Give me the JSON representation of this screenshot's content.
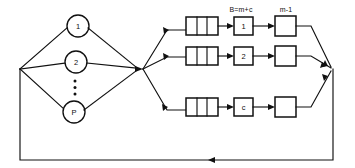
{
  "diagram": {
    "type": "closed-queueing-network",
    "column_labels": [
      {
        "id": "col-label-1",
        "text": "B=m+c",
        "x": 239,
        "y": 9
      },
      {
        "id": "col-label-2",
        "text": "m-1",
        "x": 285,
        "y": 9
      }
    ],
    "source_nodes": [
      {
        "id": "node-1",
        "label": "1",
        "cx": 78,
        "cy": 26,
        "r": 11
      },
      {
        "id": "node-2",
        "label": "2",
        "cx": 76,
        "cy": 62,
        "r": 11
      },
      {
        "id": "node-p",
        "label": "P",
        "cx": 74,
        "cy": 112,
        "r": 11
      }
    ],
    "ellipsis_dots": [
      {
        "cx": 75,
        "cy": 82
      },
      {
        "cx": 75,
        "cy": 88
      },
      {
        "cx": 75,
        "cy": 94
      }
    ],
    "queue_boxes": [
      {
        "id": "queue-row-1",
        "x": 186,
        "y": 17,
        "w": 32,
        "h": 18,
        "cells": 3
      },
      {
        "id": "queue-row-2",
        "x": 186,
        "y": 47,
        "w": 32,
        "h": 18,
        "cells": 3
      },
      {
        "id": "queue-row-3",
        "x": 186,
        "y": 98,
        "w": 32,
        "h": 18,
        "cells": 3
      }
    ],
    "service_boxes": [
      {
        "id": "service-box-1",
        "label": "1",
        "x": 234,
        "y": 17,
        "w": 19,
        "h": 18
      },
      {
        "id": "service-box-2",
        "label": "2",
        "x": 234,
        "y": 47,
        "w": 19,
        "h": 18
      },
      {
        "id": "service-box-c",
        "label": "c",
        "x": 234,
        "y": 98,
        "w": 19,
        "h": 18
      }
    ],
    "terminal_boxes": [
      {
        "id": "terminal-box-1",
        "label": "",
        "x": 275,
        "y": 16,
        "w": 21,
        "h": 20
      },
      {
        "id": "terminal-box-2",
        "label": "",
        "x": 275,
        "y": 46,
        "w": 21,
        "h": 20
      },
      {
        "id": "terminal-box-3",
        "label": "",
        "x": 275,
        "y": 97,
        "w": 21,
        "h": 20
      }
    ],
    "junctions": {
      "left_merge": {
        "x": 20,
        "y": 69
      },
      "center_split": {
        "x": 143,
        "y": 69
      },
      "right_merge": {
        "x": 333,
        "y": 69
      }
    },
    "outer_loop": {
      "left_x": 20,
      "right_x": 333,
      "bottom_y": 160,
      "feedback_arrow_x": 203
    },
    "colors": {
      "ink": "#101010",
      "paper": "#ffffff"
    }
  }
}
